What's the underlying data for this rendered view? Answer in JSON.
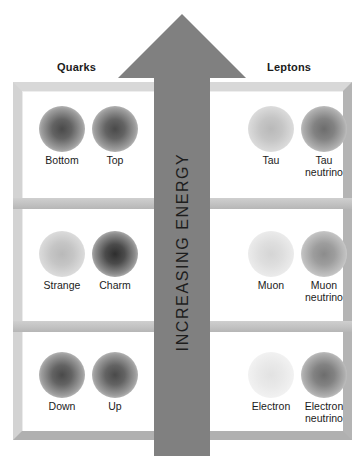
{
  "diagram": {
    "headers": {
      "quarks": "Quarks",
      "leptons": "Leptons"
    },
    "arrow": {
      "label": "INCREASING ENERGY",
      "direction": "up",
      "color": "#808080"
    },
    "frame_color": "#c8c8c8",
    "rows": [
      {
        "generation": "third",
        "quarks": [
          {
            "name": "Bottom",
            "shade": "dark"
          },
          {
            "name": "Top",
            "shade": "dark"
          }
        ],
        "leptons": [
          {
            "name": "Tau",
            "shade": "light"
          },
          {
            "name": "Tau\nneutrino",
            "shade": "mdark"
          }
        ]
      },
      {
        "generation": "second",
        "quarks": [
          {
            "name": "Strange",
            "shade": "light"
          },
          {
            "name": "Charm",
            "shade": "vdark"
          }
        ],
        "leptons": [
          {
            "name": "Muon",
            "shade": "vlight"
          },
          {
            "name": "Muon\nneutrino",
            "shade": "med"
          }
        ]
      },
      {
        "generation": "first",
        "quarks": [
          {
            "name": "Down",
            "shade": "dark"
          },
          {
            "name": "Up",
            "shade": "dark"
          }
        ],
        "leptons": [
          {
            "name": "Electron",
            "shade": "faint"
          },
          {
            "name": "Electron\nneutrino",
            "shade": "mdark"
          }
        ]
      }
    ]
  }
}
